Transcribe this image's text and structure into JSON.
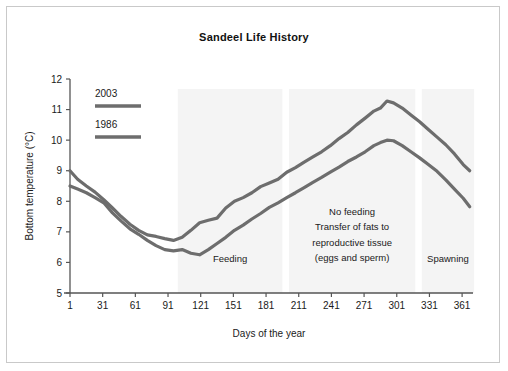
{
  "figure": {
    "title": "Sandeel Life History",
    "border_color": "#c9c9c9",
    "background": "#ffffff"
  },
  "chart_data": {
    "type": "line",
    "title": "Sandeel Life History",
    "xlabel": "Days of the year",
    "ylabel": "Bottom temperature (°C)",
    "xlim": [
      1,
      371
    ],
    "ylim": [
      5,
      12
    ],
    "grid": false,
    "legend_position": "top-left-inside",
    "xticks": [
      1,
      31,
      61,
      91,
      121,
      151,
      181,
      211,
      241,
      271,
      301,
      331,
      361
    ],
    "xtick_labels": [
      "1",
      "31",
      "61",
      "91",
      "121",
      "151",
      "181",
      "211",
      "241",
      "271",
      "301",
      "331",
      "361"
    ],
    "yticks": [
      5,
      6,
      7,
      8,
      9,
      10,
      11,
      12
    ],
    "ytick_labels": [
      "5",
      "6",
      "7",
      "8",
      "9",
      "10",
      "11",
      "12"
    ],
    "line_color": "#6d6d6d",
    "line_width": 3.2,
    "series": [
      {
        "name": "2003",
        "color": "#6d6d6d",
        "x": [
          1,
          8,
          16,
          24,
          32,
          40,
          48,
          56,
          64,
          72,
          80,
          88,
          96,
          104,
          112,
          120,
          128,
          136,
          144,
          152,
          160,
          168,
          176,
          184,
          192,
          200,
          208,
          216,
          224,
          232,
          240,
          248,
          256,
          264,
          272,
          280,
          286,
          292,
          298,
          306,
          314,
          322,
          330,
          338,
          346,
          354,
          362,
          368
        ],
        "values": [
          9.0,
          8.72,
          8.5,
          8.3,
          8.05,
          7.78,
          7.5,
          7.25,
          7.05,
          6.9,
          6.85,
          6.78,
          6.72,
          6.82,
          7.05,
          7.3,
          7.38,
          7.45,
          7.78,
          8.0,
          8.12,
          8.28,
          8.48,
          8.6,
          8.72,
          8.95,
          9.1,
          9.28,
          9.45,
          9.62,
          9.82,
          10.05,
          10.25,
          10.5,
          10.72,
          10.95,
          11.05,
          11.28,
          11.22,
          11.05,
          10.82,
          10.6,
          10.35,
          10.1,
          9.85,
          9.55,
          9.2,
          9.0
        ]
      },
      {
        "name": "1986",
        "color": "#6d6d6d",
        "x": [
          1,
          8,
          16,
          24,
          32,
          40,
          48,
          56,
          64,
          72,
          80,
          88,
          96,
          104,
          112,
          120,
          128,
          136,
          144,
          152,
          160,
          168,
          176,
          184,
          192,
          200,
          208,
          216,
          224,
          232,
          240,
          248,
          256,
          264,
          272,
          280,
          286,
          292,
          298,
          306,
          314,
          322,
          330,
          338,
          346,
          354,
          362,
          368
        ],
        "values": [
          8.5,
          8.4,
          8.28,
          8.12,
          7.95,
          7.62,
          7.35,
          7.1,
          6.92,
          6.72,
          6.55,
          6.42,
          6.38,
          6.42,
          6.3,
          6.25,
          6.42,
          6.62,
          6.82,
          7.05,
          7.22,
          7.42,
          7.6,
          7.8,
          7.95,
          8.12,
          8.28,
          8.45,
          8.62,
          8.78,
          8.95,
          9.12,
          9.3,
          9.45,
          9.62,
          9.82,
          9.92,
          10.0,
          9.98,
          9.82,
          9.62,
          9.42,
          9.2,
          8.98,
          8.7,
          8.4,
          8.1,
          7.82
        ]
      }
    ],
    "bands": [
      {
        "name": "feeding-band",
        "x_start": 100,
        "x_end": 196,
        "label": "Feeding",
        "color": "#f4f4f4"
      },
      {
        "name": "no-feeding-band",
        "x_start": 202,
        "x_end": 318,
        "label": "No feeding",
        "label_lines": [
          "No feeding",
          "Transfer of fats to",
          "reproductive tissue",
          "(eggs and sperm)"
        ],
        "color": "#f4f4f4"
      },
      {
        "name": "spawning-band",
        "x_start": 324,
        "x_end": 372,
        "label": "Spawning",
        "color": "#f4f4f4"
      }
    ],
    "annotations": [
      {
        "text": "Feeding",
        "x": 148,
        "y": 6.0
      },
      {
        "text": "No feeding",
        "x": 260,
        "y": 7.55
      },
      {
        "text": "Transfer of fats to",
        "x": 260,
        "y": 7.05
      },
      {
        "text": "reproductive tissue",
        "x": 260,
        "y": 6.55
      },
      {
        "text": "(eggs and sperm)",
        "x": 260,
        "y": 6.05
      },
      {
        "text": "Spawning",
        "x": 348,
        "y": 6.0
      }
    ]
  },
  "legend": {
    "items": [
      {
        "label": "2003",
        "color": "#6d6d6d"
      },
      {
        "label": "1986",
        "color": "#6d6d6d"
      }
    ]
  }
}
